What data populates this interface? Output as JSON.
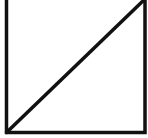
{
  "diagram": {
    "shape": "square-with-diagonal",
    "stroke_color": "#111111",
    "background_color": "#ffffff",
    "square": {
      "left": 6.5,
      "top": -2,
      "right": 145,
      "bottom": 132.5
    },
    "diagonal": {
      "from": "bottom-left",
      "to": "top-right"
    }
  }
}
